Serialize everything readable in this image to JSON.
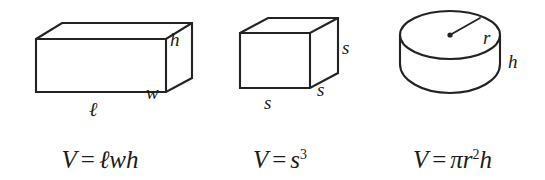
{
  "figure": {
    "background_color": "#ffffff",
    "stroke_color": "#232323",
    "text_color": "#1c1c1c"
  },
  "panels": [
    {
      "id": "rectangular-prism",
      "shape": "rectangular-prism",
      "labels": {
        "height": "h",
        "width": "w",
        "length": "ℓ"
      },
      "formula": {
        "lhs": "V",
        "equals": "=",
        "terms": [
          "ℓ",
          "w",
          "h"
        ],
        "plain": "V = ℓwh"
      }
    },
    {
      "id": "cube",
      "shape": "cube",
      "labels": {
        "side_right": "s",
        "side_depth": "s",
        "side_bottom": "s"
      },
      "formula": {
        "lhs": "V",
        "equals": "=",
        "base": "s",
        "exponent": "3",
        "plain": "V = s³"
      }
    },
    {
      "id": "cylinder",
      "shape": "cylinder",
      "labels": {
        "radius": "r",
        "height": "h"
      },
      "formula": {
        "lhs": "V",
        "equals": "=",
        "pi": "π",
        "base": "r",
        "exponent": "2",
        "height": "h",
        "plain": "V = πr²h"
      }
    }
  ]
}
